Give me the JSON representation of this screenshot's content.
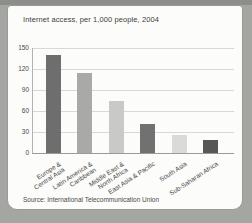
{
  "page": {
    "background_color": "#a4a6a2",
    "top_band_color": "#8c8e8a"
  },
  "card": {
    "background_color": "#fcfcfa",
    "border_color": "#9a9a98"
  },
  "chart_data": {
    "type": "bar",
    "title": "Internet access, per 1,000 people, 2004",
    "source": "Source: International Telecommunication Union",
    "categories": [
      "Europe & Central Asia",
      "Latin America & Caribbean",
      "Middle East & North Africa",
      "East Asia & Pacific",
      "South Asia",
      "Sub-Saharan Africa"
    ],
    "category_lines": [
      [
        "Europe &",
        "Central Asia"
      ],
      [
        "Latin America &",
        "Caribbean"
      ],
      [
        "Middle East &",
        "North Africa"
      ],
      [
        "East Asia & Pacific"
      ],
      [
        "South Asia"
      ],
      [
        "Sub-Saharan Africa"
      ]
    ],
    "values": [
      140,
      114,
      74,
      42,
      26,
      19
    ],
    "bar_colors": [
      "#6e6e6e",
      "#a9a9a7",
      "#c9c9c7",
      "#717171",
      "#dadad8",
      "#575757"
    ],
    "yticks": [
      0,
      30,
      60,
      90,
      120,
      150
    ],
    "ylim": [
      0,
      150
    ],
    "grid": true,
    "legend": false,
    "gridline_color": "#d8d8d6",
    "axis_color": "#9a9a98",
    "text_color": "#4a4a48"
  }
}
